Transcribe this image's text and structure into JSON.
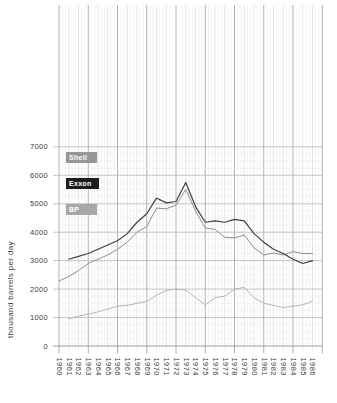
{
  "page": {
    "background": "#ffffff"
  },
  "chart_data": {
    "type": "line",
    "title": "",
    "xlabel": "",
    "ylabel": "thousand barrels per day",
    "x_labels": [
      "1960",
      "1961",
      "1962",
      "1963",
      "1964",
      "1965",
      "1966",
      "1967",
      "1968",
      "1969",
      "1970",
      "1971",
      "1972",
      "1973",
      "1974",
      "1975",
      "1976",
      "1977",
      "1978",
      "1979",
      "1980",
      "1981",
      "1982",
      "1983",
      "1984",
      "1985",
      "1986"
    ],
    "yticks": [
      0,
      1000,
      2000,
      3000,
      4000,
      5000,
      6000,
      7000
    ],
    "ylim": [
      0,
      7000
    ],
    "y_minor_step": 250,
    "x_major_every_years": 3,
    "grid": "on (fine graph-paper style)",
    "legend_position": "upper-left",
    "series": [
      {
        "name": "Shell",
        "color": "#8f8f8f",
        "chip_color": "#94969a",
        "values": [
          2280,
          2450,
          2650,
          2900,
          3050,
          3200,
          3400,
          3650,
          4000,
          4200,
          4850,
          4820,
          4950,
          5500,
          4750,
          4150,
          4100,
          3820,
          3800,
          3900,
          3450,
          3200,
          3270,
          3200,
          3320,
          3250,
          3250
        ]
      },
      {
        "name": "Exxon",
        "color": "#3f3f3f",
        "chip_color": "#1d1d1d",
        "values": [
          null,
          3050,
          3150,
          3250,
          3400,
          3550,
          3700,
          3950,
          4350,
          4650,
          5200,
          5030,
          5080,
          5750,
          4900,
          4350,
          4400,
          4350,
          4450,
          4400,
          3950,
          3650,
          3400,
          3250,
          3050,
          2900,
          3000
        ]
      },
      {
        "name": "BP",
        "color": "#b4b4b4",
        "chip_color": "#a5a7a9",
        "values": [
          null,
          950,
          1050,
          1120,
          1200,
          1300,
          1400,
          1430,
          1500,
          1570,
          1780,
          1950,
          2000,
          1970,
          1700,
          1450,
          1700,
          1750,
          2000,
          2060,
          1700,
          1500,
          1430,
          1350,
          1400,
          1450,
          1580
        ]
      }
    ],
    "grid_colors": {
      "vertical_major": "#9c9c9c",
      "vertical_year": "#d9d9d9",
      "minor": "#ececec",
      "horizontal_major": "#b5b5b5",
      "baseline": "#8a8a8a"
    },
    "tick_label_color": "#3d3d3d"
  }
}
